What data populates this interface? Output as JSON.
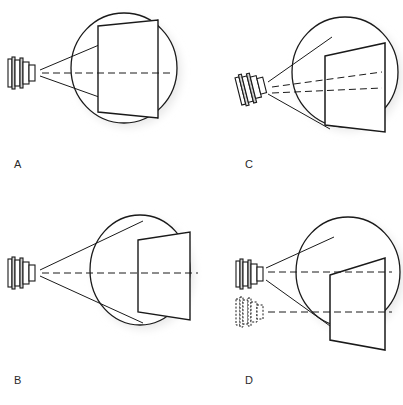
{
  "figure": {
    "title": "",
    "background_color": "#ffffff",
    "stroke_color": "#1a1a1a",
    "shadow_color": "#e6e6e6",
    "label_color": "#2a2a2a",
    "panel_count": 4
  },
  "panels": [
    {
      "id": "A",
      "label": "A",
      "label_x": 14,
      "label_y": 168,
      "description": "Projector aligned on axis; projected image inscribed exactly within the circular screen area",
      "projector": {
        "name": "projector-a",
        "cx": 22,
        "cy": 72,
        "rotation_deg": 0,
        "style": "solid",
        "rings": 6
      },
      "circle": {
        "cx": 124,
        "cy": 68,
        "rx": 53,
        "ry": 55,
        "style": "solid",
        "shadow": true
      },
      "screen": {
        "name": "screen-a",
        "style": "solid",
        "fit": "inscribed",
        "points": "98,26 158,20 158,118 98,112"
      },
      "rays": [
        {
          "name": "ray-upper",
          "x1": 40,
          "y1": 70,
          "x2": 158,
          "y2": 20
        },
        {
          "name": "ray-lower",
          "x1": 40,
          "y1": 76,
          "x2": 158,
          "y2": 118
        }
      ],
      "axis": {
        "name": "optical-axis-a",
        "x1": 42,
        "y1": 73,
        "x2": 170,
        "y2": 73,
        "style": "dashed"
      }
    },
    {
      "id": "B",
      "label": "B",
      "label_x": 14,
      "label_y": 384,
      "description": "Projector aligned on axis; projected image smaller than and fully contained inside the circular screen area",
      "projector": {
        "name": "projector-b",
        "cx": 22,
        "cy": 272,
        "rotation_deg": 0,
        "style": "solid",
        "rings": 6
      },
      "circle": {
        "cx": 140,
        "cy": 270,
        "rx": 50,
        "ry": 55,
        "style": "solid",
        "shadow": true
      },
      "circle_clip_right": 196,
      "screen": {
        "name": "screen-b",
        "style": "solid",
        "fit": "contained",
        "points": "138,240 188,232 188,320 138,312"
      },
      "rays": [
        {
          "name": "ray-upper",
          "x1": 40,
          "y1": 270,
          "x2": 142,
          "y2": 222
        },
        {
          "name": "ray-lower",
          "x1": 40,
          "y1": 276,
          "x2": 142,
          "y2": 322
        }
      ],
      "axis": {
        "name": "optical-axis-b",
        "x1": 42,
        "y1": 273,
        "x2": 196,
        "y2": 273,
        "style": "dashed"
      }
    },
    {
      "id": "C",
      "label": "C",
      "label_x": 245,
      "label_y": 168,
      "description": "Projector tilted off axis; projected image is keystoned and spills below the circular screen area",
      "projector": {
        "name": "projector-c",
        "cx": 252,
        "cy": 88,
        "rotation_deg": -14,
        "style": "solid",
        "rings": 6
      },
      "circle": {
        "cx": 345,
        "cy": 72,
        "rx": 53,
        "ry": 55,
        "style": "solid",
        "shadow": true
      },
      "circle_clip_right": 400,
      "screen": {
        "name": "screen-c",
        "style": "solid",
        "fit": "overflow-bottom",
        "points": "325,56 385,43 385,132 325,125"
      },
      "rays": [
        {
          "name": "ray-upper",
          "x1": 268,
          "y1": 82,
          "x2": 330,
          "y2": 38
        },
        {
          "name": "ray-lower",
          "x1": 268,
          "y1": 94,
          "x2": 330,
          "y2": 128
        }
      ],
      "axis_lines": [
        {
          "name": "optical-axis-c-tilted",
          "x1": 270,
          "y1": 86,
          "x2": 380,
          "y2": 73,
          "style": "dashed"
        },
        {
          "name": "optical-axis-c-reference",
          "x1": 270,
          "y1": 92,
          "x2": 380,
          "y2": 88,
          "style": "dashed"
        }
      ]
    },
    {
      "id": "D",
      "label": "D",
      "label_x": 245,
      "label_y": 384,
      "description": "Projector shifted upward from its original (dashed) position; projected image is keystoned and extends below the circular screen area",
      "projector": {
        "name": "projector-d",
        "cx": 250,
        "cy": 274,
        "rotation_deg": 0,
        "style": "solid",
        "rings": 6
      },
      "ghost_projector": {
        "name": "ghost-projector-d",
        "cx": 250,
        "cy": 312,
        "rotation_deg": 0,
        "style": "dashed",
        "rings": 6
      },
      "circle": {
        "cx": 348,
        "cy": 272,
        "rx": 52,
        "ry": 55,
        "style": "solid",
        "shadow": true
      },
      "circle_clip_right": 400,
      "screen": {
        "name": "screen-d",
        "style": "solid",
        "fit": "overflow-bottom",
        "points": "330,275 385,258 385,350 330,340"
      },
      "rays": [
        {
          "name": "ray-upper",
          "x1": 266,
          "y1": 268,
          "x2": 332,
          "y2": 238
        },
        {
          "name": "ray-lower",
          "x1": 266,
          "y1": 280,
          "x2": 340,
          "y2": 332
        }
      ],
      "axis_lines": [
        {
          "name": "optical-axis-d-upper",
          "x1": 268,
          "y1": 272,
          "x2": 390,
          "y2": 272,
          "style": "dashed"
        },
        {
          "name": "optical-axis-d-lower",
          "x1": 268,
          "y1": 312,
          "x2": 390,
          "y2": 312,
          "style": "dashed"
        }
      ]
    }
  ]
}
